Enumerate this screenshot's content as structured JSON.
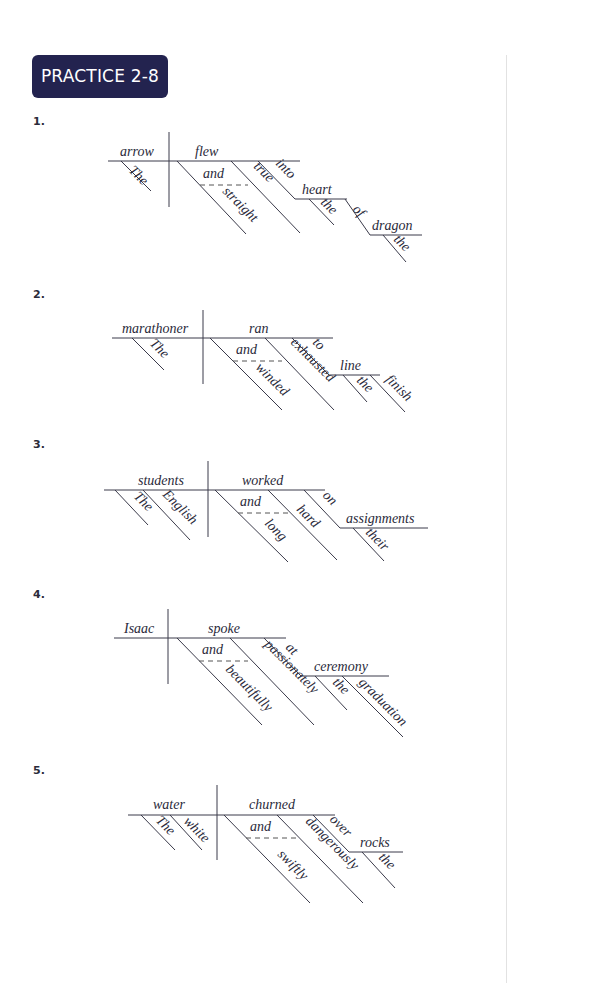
{
  "page": {
    "title": "PRACTICE 2-8",
    "colors": {
      "badge_bg": "#23234f",
      "badge_text": "#ffffff",
      "line": "#3a3a4a"
    }
  },
  "exercises": [
    {
      "number": "1.",
      "sentence_parts": {
        "subject": "arrow",
        "subject_modifier": "The",
        "verb": "flew",
        "conjunction": "and",
        "adverb_1": "straight",
        "adverb_2": "true",
        "preposition": "into",
        "object": "heart",
        "object_modifier": "the",
        "preposition_2": "of",
        "object_2": "dragon",
        "object_2_modifier": "the"
      }
    },
    {
      "number": "2.",
      "sentence_parts": {
        "subject": "marathoner",
        "subject_modifier": "The",
        "verb": "ran",
        "conjunction": "and",
        "adverb_1": "winded",
        "adverb_2": "exhausted",
        "preposition": "to",
        "object": "line",
        "object_modifier": "the",
        "object_modifier_2": "finish"
      }
    },
    {
      "number": "3.",
      "sentence_parts": {
        "subject": "students",
        "subject_modifier": "The",
        "subject_modifier_2": "English",
        "verb": "worked",
        "conjunction": "and",
        "adverb_1": "long",
        "adverb_2": "hard",
        "preposition": "on",
        "object": "assignments",
        "object_modifier": "their"
      }
    },
    {
      "number": "4.",
      "sentence_parts": {
        "subject": "Isaac",
        "verb": "spoke",
        "conjunction": "and",
        "adverb_1": "beautifully",
        "adverb_2": "passionately",
        "preposition": "at",
        "object": "ceremony",
        "object_modifier": "the",
        "object_modifier_2": "graduation"
      }
    },
    {
      "number": "5.",
      "sentence_parts": {
        "subject": "water",
        "subject_modifier": "The",
        "subject_modifier_2": "white",
        "verb": "churned",
        "conjunction": "and",
        "adverb_1": "swiftly",
        "adverb_2": "dangerously",
        "preposition": "over",
        "object": "rocks",
        "object_modifier": "the"
      }
    }
  ]
}
